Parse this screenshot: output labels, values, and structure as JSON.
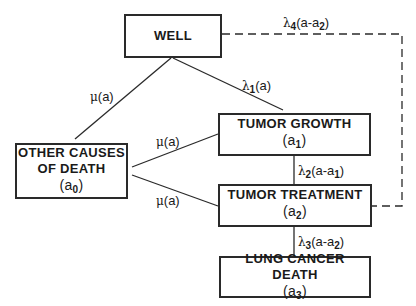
{
  "diagram": {
    "nodes": {
      "well": {
        "label": "WELL"
      },
      "tumor_growth": {
        "label": "TUMOR GROWTH",
        "age_var": "a",
        "age_sub": "1"
      },
      "other_causes": {
        "label_line1": "OTHER CAUSES",
        "label_line2": "OF DEATH",
        "age_var": "a",
        "age_sub": "0"
      },
      "tumor_treatment": {
        "label": "TUMOR TREATMENT",
        "age_var": "a",
        "age_sub": "2"
      },
      "lung_cancer_death": {
        "label": "LUNG CANCER DEATH",
        "age_var": "a",
        "age_sub": "3"
      }
    },
    "edges": {
      "well_to_other": {
        "sym": "μ",
        "text": "(a)"
      },
      "well_to_growth": {
        "sym": "λ",
        "sub": "1",
        "text": "(a)"
      },
      "well_to_death_dashed": {
        "sym": "λ",
        "sub": "4",
        "text": "(a-a",
        "sub2": "2",
        "end": ")"
      },
      "growth_to_other": {
        "sym": "μ",
        "text": "(a)"
      },
      "treatment_to_other": {
        "sym": "μ",
        "text": "(a)"
      },
      "growth_to_treatment": {
        "sym": "λ",
        "sub": "2",
        "text": "(a-a",
        "sub2": "1",
        "end": ")"
      },
      "treatment_to_death": {
        "sym": "λ",
        "sub": "3",
        "text": "(a-a",
        "sub2": "2",
        "end": ")"
      }
    },
    "colors": {
      "line": "#2a2a2a",
      "background": "#ffffff"
    }
  }
}
